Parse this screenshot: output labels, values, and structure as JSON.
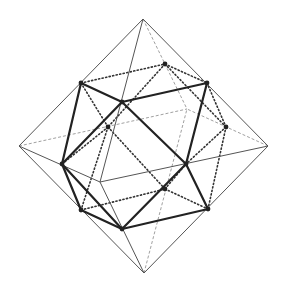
{
  "figure": {
    "background": "#ffffff"
  },
  "octahedron": {
    "vertices": {
      "top": [
        143,
        19
      ],
      "left": [
        19,
        146
      ],
      "right": [
        268,
        146
      ],
      "bottom": [
        144,
        273
      ],
      "front": [
        100,
        182
      ],
      "back": [
        187,
        109
      ]
    },
    "visible_edges": [
      [
        "top",
        "left"
      ],
      [
        "top",
        "right"
      ],
      [
        "bottom",
        "left"
      ],
      [
        "bottom",
        "right"
      ],
      [
        "top",
        "front"
      ],
      [
        "left",
        "front"
      ],
      [
        "right",
        "front"
      ],
      [
        "bottom",
        "front"
      ]
    ],
    "hidden_edges": [
      [
        "top",
        "back"
      ],
      [
        "left",
        "back"
      ],
      [
        "right",
        "back"
      ],
      [
        "bottom",
        "back"
      ]
    ]
  },
  "cuboctahedron": {
    "vertices": {
      "A": [
        81,
        83
      ],
      "B": [
        165,
        64
      ],
      "C": [
        207,
        83
      ],
      "D": [
        122,
        102
      ],
      "E": [
        108,
        127
      ],
      "F": [
        226,
        127
      ],
      "G": [
        62,
        164
      ],
      "H": [
        186,
        164
      ],
      "I": [
        165,
        189
      ],
      "J": [
        81,
        210
      ],
      "K": [
        208,
        209
      ],
      "L": [
        122,
        229
      ]
    },
    "visible_edges": [
      [
        "A",
        "D"
      ],
      [
        "D",
        "C"
      ],
      [
        "A",
        "G"
      ],
      [
        "G",
        "D"
      ],
      [
        "C",
        "H"
      ],
      [
        "D",
        "H"
      ],
      [
        "G",
        "J"
      ],
      [
        "J",
        "L"
      ],
      [
        "G",
        "L"
      ],
      [
        "H",
        "L"
      ],
      [
        "H",
        "K"
      ],
      [
        "L",
        "K"
      ]
    ],
    "hidden_edges": [
      [
        "A",
        "B"
      ],
      [
        "B",
        "C"
      ],
      [
        "A",
        "E"
      ],
      [
        "B",
        "E"
      ],
      [
        "B",
        "F"
      ],
      [
        "C",
        "F"
      ],
      [
        "F",
        "H"
      ],
      [
        "F",
        "K"
      ],
      [
        "E",
        "I"
      ],
      [
        "E",
        "J"
      ],
      [
        "J",
        "I"
      ],
      [
        "I",
        "K"
      ],
      [
        "I",
        "H"
      ],
      [
        "E",
        "G"
      ]
    ]
  }
}
